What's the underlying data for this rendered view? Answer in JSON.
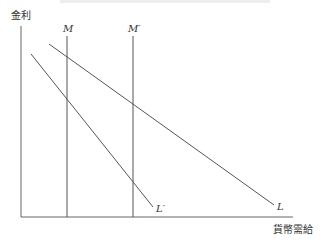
{
  "diagram": {
    "y_axis_label": "金利",
    "x_axis_label": "貨幣需給",
    "lines": {
      "M": "M",
      "M_prime": "M′",
      "L": "L",
      "L_prime": "L′"
    },
    "colors": {
      "line": "#555555",
      "axis": "#666666",
      "text": "#333333"
    }
  }
}
